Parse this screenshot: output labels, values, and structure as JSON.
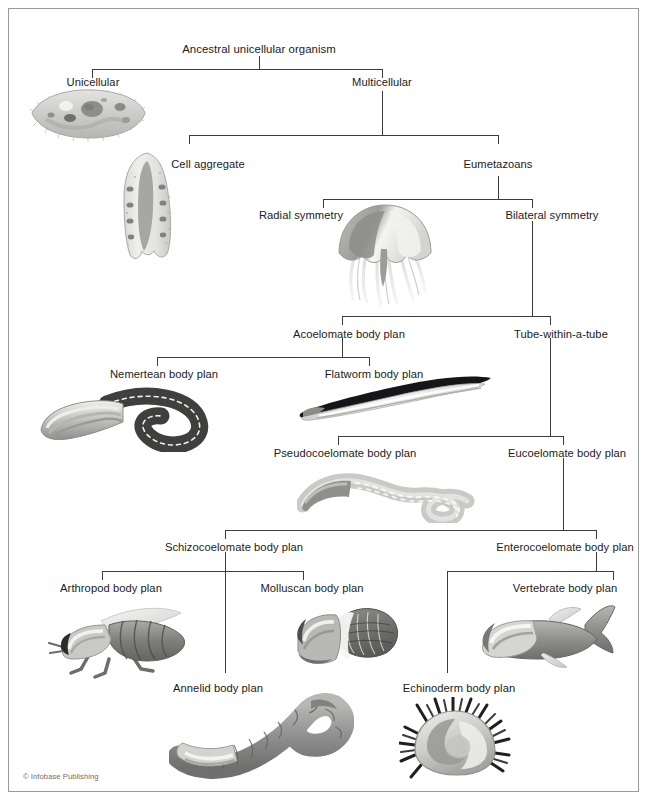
{
  "figure": {
    "title_node": "Ancestral unicellular organism",
    "credit": "© Infobase Publishing",
    "border_color": "#9a9a9a",
    "line_color": "#3c3c3c",
    "text_color": "#1b1b1b",
    "background": "#ffffff"
  },
  "nodes": {
    "ancestral": "Ancestral unicellular organism",
    "unicellular": "Unicellular",
    "multicellular": "Multicellular",
    "cell_aggregate": "Cell aggregate",
    "eumetazoans": "Eumetazoans",
    "radial_symmetry": "Radial symmetry",
    "bilateral_symmetry": "Bilateral symmetry",
    "acoelomate": "Acoelomate body plan",
    "tube_within_tube": "Tube-within-a-tube",
    "nemertean": "Nemertean body plan",
    "flatworm": "Flatworm body plan",
    "pseudocoelomate": "Pseudocoelomate body plan",
    "eucoelomate": "Eucoelomate body plan",
    "schizocoelomate": "Schizocoelomate body plan",
    "enterocoelomate": "Enterocoelomate body plan",
    "arthropod": "Arthropod body plan",
    "molluscan": "Molluscan body plan",
    "annelid": "Annelid body plan",
    "echinoderm": "Echinoderm body plan",
    "vertebrate": "Vertebrate body plan"
  },
  "illustrations": {
    "paramecium": "paramecium-illustration",
    "sponge": "sponge-illustration",
    "jellyfish": "jellyfish-illustration",
    "ribbon_worm": "nemertean-worm-illustration",
    "flatworm": "flatworm-illustration",
    "roundworm": "pseudocoelomate-roundworm-illustration",
    "insect": "arthropod-insect-illustration",
    "mollusc": "mollusc-illustration",
    "earthworm": "annelid-earthworm-illustration",
    "sea_urchin": "echinoderm-sea-urchin-illustration",
    "fish": "vertebrate-fish-illustration"
  }
}
